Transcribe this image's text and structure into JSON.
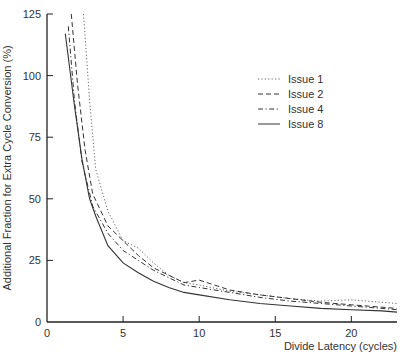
{
  "chart_data": {
    "type": "line",
    "title": "",
    "xlabel": "Divide Latency (cycles)",
    "ylabel": "Additional Fraction for Extra Cycle Conversion (%)",
    "xlim": [
      0,
      23
    ],
    "ylim": [
      0,
      125
    ],
    "xticks": [
      0,
      5,
      10,
      15,
      20
    ],
    "yticks": [
      0,
      25,
      50,
      75,
      100,
      125
    ],
    "grid": false,
    "legend_position": "upper right",
    "series": [
      {
        "name": "Issue 1",
        "style": "dotted",
        "x": [
          2.4,
          2.8,
          3.2,
          4,
          5,
          6,
          7,
          8,
          9,
          10,
          12,
          14,
          16,
          18,
          20,
          21,
          22,
          23
        ],
        "y": [
          125,
          90,
          62,
          45,
          33,
          30,
          24,
          19,
          16,
          15,
          12.5,
          11,
          9.5,
          8.5,
          9,
          8.5,
          8,
          7.5
        ]
      },
      {
        "name": "Issue 2",
        "style": "dashed",
        "x": [
          1.6,
          2,
          2.5,
          3,
          4,
          5,
          6,
          7,
          8,
          9,
          10,
          11,
          12,
          14,
          16,
          18,
          20,
          22,
          23
        ],
        "y": [
          125,
          97,
          70,
          52,
          39,
          33,
          27,
          22,
          19,
          16,
          17,
          15,
          13,
          11,
          9.5,
          8,
          7,
          6,
          5.5
        ]
      },
      {
        "name": "Issue 4",
        "style": "dash-dot",
        "x": [
          1.4,
          1.8,
          2.3,
          3,
          4,
          5,
          6,
          7,
          8,
          9,
          10,
          12,
          14,
          16,
          18,
          20,
          22,
          23
        ],
        "y": [
          120,
          90,
          65,
          47,
          36,
          29,
          25,
          21,
          18,
          15,
          14,
          12,
          10,
          8.5,
          7.5,
          6.5,
          5.5,
          5
        ]
      },
      {
        "name": "Issue 8",
        "style": "solid",
        "x": [
          1.2,
          1.8,
          2.3,
          2.8,
          3.2,
          4,
          5,
          6,
          7,
          8,
          9,
          10,
          12,
          14,
          16,
          18,
          20,
          22,
          23
        ],
        "y": [
          117,
          88,
          66,
          50,
          43,
          31,
          24,
          20,
          16.5,
          14,
          12,
          11,
          9,
          7.5,
          6.5,
          5.5,
          5,
          4.5,
          4
        ]
      }
    ]
  },
  "legend": {
    "items": [
      {
        "label": "Issue 1"
      },
      {
        "label": "Issue 2"
      },
      {
        "label": "Issue 4"
      },
      {
        "label": "Issue 8"
      }
    ]
  },
  "axes": {
    "x_title": "Divide Latency (cycles)",
    "y_title": "Additional Fraction for Extra Cycle Conversion (%)",
    "x_tick_labels": [
      "0",
      "5",
      "10",
      "15",
      "20"
    ],
    "y_tick_labels": [
      "0",
      "25",
      "50",
      "75",
      "100",
      "125"
    ]
  },
  "colors": {
    "line": "#333333",
    "axis": "#222222",
    "background": "#ffffff"
  }
}
